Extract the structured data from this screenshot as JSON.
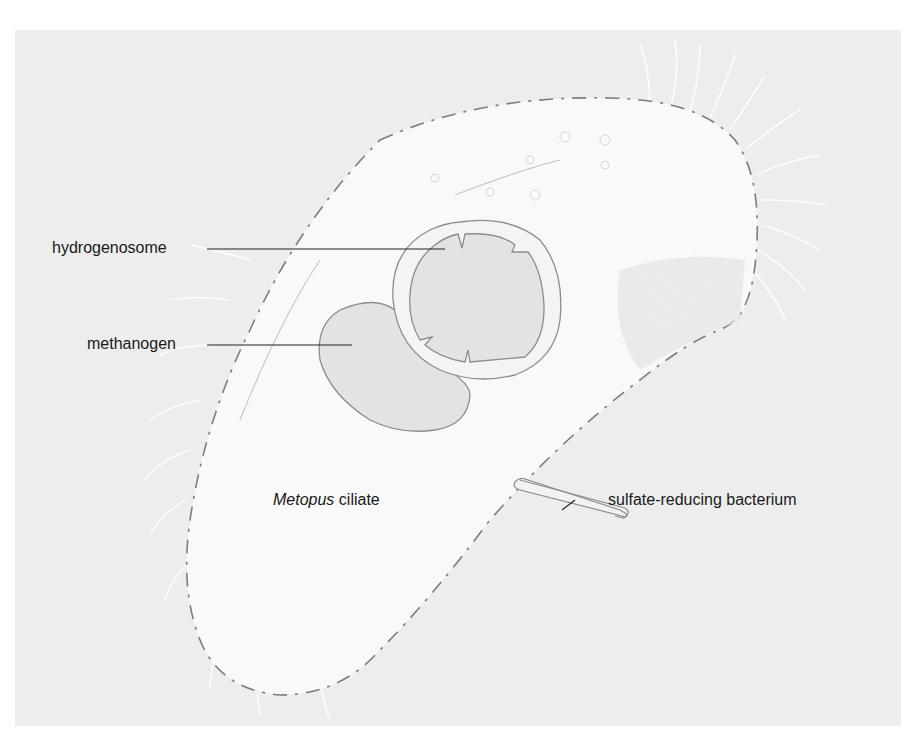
{
  "figure": {
    "labels": {
      "hydrogenosome": "hydrogenosome",
      "methanogen": "methanogen",
      "ciliate_genus": "Metopus",
      "ciliate_suffix": " ciliate",
      "sulfate_bacterium": "sulfate-reducing bacterium"
    },
    "colors": {
      "background_panel": "#ededed",
      "cell_body": "#f8f8f8",
      "organelle_fill": "#e2e2e2",
      "outline": "#8a8a8a",
      "leader_line": "#222222",
      "text": "#1a1a1a"
    }
  }
}
